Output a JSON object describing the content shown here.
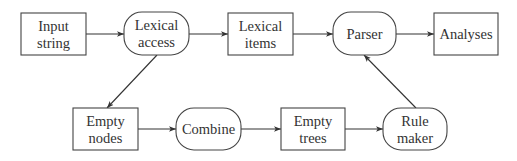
{
  "diagram": {
    "type": "flowchart",
    "nodes": [
      {
        "id": "input_string",
        "shape": "rect",
        "lines": [
          "Input",
          "string"
        ],
        "x": 21,
        "y": 13,
        "w": 65,
        "h": 42
      },
      {
        "id": "lexical_access",
        "shape": "rounded",
        "lines": [
          "Lexical",
          "access"
        ],
        "x": 124,
        "y": 12,
        "w": 65,
        "h": 43
      },
      {
        "id": "lexical_items",
        "shape": "rect",
        "lines": [
          "Lexical",
          "items"
        ],
        "x": 228,
        "y": 13,
        "w": 65,
        "h": 42
      },
      {
        "id": "parser",
        "shape": "rounded",
        "lines": [
          "Parser"
        ],
        "x": 333,
        "y": 12,
        "w": 63,
        "h": 43
      },
      {
        "id": "analyses",
        "shape": "rect",
        "lines": [
          "Analyses"
        ],
        "x": 434,
        "y": 13,
        "w": 64,
        "h": 42
      },
      {
        "id": "empty_nodes",
        "shape": "rect",
        "lines": [
          "Empty",
          "nodes"
        ],
        "x": 73,
        "y": 108,
        "w": 65,
        "h": 42
      },
      {
        "id": "combine",
        "shape": "rounded",
        "lines": [
          "Combine"
        ],
        "x": 176,
        "y": 108,
        "w": 65,
        "h": 42
      },
      {
        "id": "empty_trees",
        "shape": "rect",
        "lines": [
          "Empty",
          "trees"
        ],
        "x": 281,
        "y": 108,
        "w": 64,
        "h": 42
      },
      {
        "id": "rule_maker",
        "shape": "rounded",
        "lines": [
          "Rule",
          "maker"
        ],
        "x": 383,
        "y": 108,
        "w": 64,
        "h": 42
      }
    ],
    "edges": [
      {
        "from": "input_string",
        "to": "lexical_access",
        "x1": 86,
        "y1": 34,
        "x2": 124,
        "y2": 34
      },
      {
        "from": "lexical_access",
        "to": "lexical_items",
        "x1": 189,
        "y1": 34,
        "x2": 228,
        "y2": 34
      },
      {
        "from": "lexical_items",
        "to": "parser",
        "x1": 293,
        "y1": 34,
        "x2": 333,
        "y2": 34
      },
      {
        "from": "parser",
        "to": "analyses",
        "x1": 396,
        "y1": 34,
        "x2": 434,
        "y2": 34
      },
      {
        "from": "lexical_access",
        "to": "empty_nodes",
        "x1": 157,
        "y1": 55,
        "x2": 107,
        "y2": 108
      },
      {
        "from": "empty_nodes",
        "to": "combine",
        "x1": 138,
        "y1": 129,
        "x2": 176,
        "y2": 129
      },
      {
        "from": "combine",
        "to": "empty_trees",
        "x1": 241,
        "y1": 129,
        "x2": 281,
        "y2": 129
      },
      {
        "from": "empty_trees",
        "to": "rule_maker",
        "x1": 345,
        "y1": 129,
        "x2": 383,
        "y2": 129
      },
      {
        "from": "rule_maker",
        "to": "parser",
        "x1": 416,
        "y1": 108,
        "x2": 364,
        "y2": 55
      }
    ],
    "colors": {
      "stroke": "#444444",
      "text": "#333333",
      "background": "#ffffff"
    }
  }
}
